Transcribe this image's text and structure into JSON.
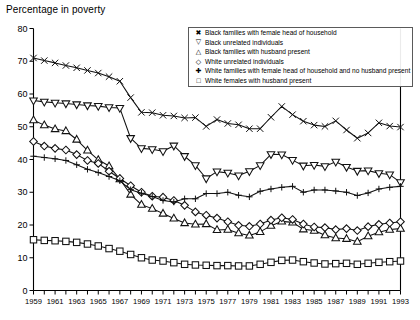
{
  "chart_data": {
    "type": "line",
    "title": "Percentage in poverty",
    "xlabel": "",
    "ylabel": "",
    "ylim": [
      0,
      80
    ],
    "ytick_step": 10,
    "yticks": [
      0,
      10,
      20,
      30,
      40,
      50,
      60,
      70,
      80
    ],
    "xlim": [
      1959,
      1993
    ],
    "grid": false,
    "legend_position": "top-right",
    "x": [
      1959,
      1960,
      1961,
      1962,
      1963,
      1964,
      1965,
      1966,
      1967,
      1968,
      1969,
      1970,
      1971,
      1972,
      1973,
      1974,
      1975,
      1976,
      1977,
      1978,
      1979,
      1980,
      1981,
      1982,
      1983,
      1984,
      1985,
      1986,
      1987,
      1988,
      1989,
      1990,
      1991,
      1992,
      1993
    ],
    "xtick_labels": [
      "1959",
      "1961",
      "1963",
      "1965",
      "1967",
      "1969",
      "1971",
      "1973",
      "1975",
      "1977",
      "1979",
      "1981",
      "1983",
      "1985",
      "1987",
      "1989",
      "1991",
      "1993"
    ],
    "series": [
      {
        "name": "Black families with female head of household",
        "marker": "x",
        "values": [
          71.0,
          70.2,
          69.5,
          68.7,
          68.0,
          67.2,
          66.4,
          65.3,
          63.9,
          58.9,
          54.4,
          54.3,
          53.5,
          53.3,
          52.7,
          52.8,
          50.1,
          52.2,
          51.0,
          50.6,
          49.4,
          49.4,
          52.9,
          56.2,
          53.7,
          51.7,
          50.5,
          50.1,
          51.8,
          49.0,
          46.5,
          48.1,
          51.2,
          50.2,
          49.9
        ]
      },
      {
        "name": "Black unrelated individuals",
        "marker": "triangle-down",
        "values": [
          58.0,
          57.6,
          57.3,
          57.1,
          56.8,
          56.5,
          56.3,
          55.9,
          55.7,
          46.5,
          43.4,
          43.1,
          42.5,
          44.2,
          41.0,
          38.2,
          34.2,
          36.3,
          35.9,
          35.1,
          36.4,
          38.2,
          41.6,
          41.5,
          39.8,
          38.1,
          38.3,
          37.9,
          39.3,
          37.7,
          36.5,
          36.6,
          35.8,
          35.4,
          33.0
        ]
      },
      {
        "name": "Black families with husband present",
        "marker": "triangle-up",
        "values": [
          52.0,
          50.5,
          49.3,
          48.7,
          46.1,
          42.8,
          39.9,
          38.0,
          34.0,
          29.3,
          26.2,
          25.0,
          23.5,
          22.0,
          20.6,
          20.2,
          20.3,
          18.5,
          18.6,
          17.5,
          16.8,
          17.9,
          19.8,
          21.1,
          20.8,
          18.7,
          18.3,
          16.9,
          16.0,
          15.8,
          14.9,
          16.6,
          17.8,
          18.6,
          18.9
        ]
      },
      {
        "name": "White unrelated individuals",
        "marker": "diamond",
        "values": [
          45.5,
          44.1,
          43.4,
          42.9,
          41.5,
          39.7,
          38.8,
          36.4,
          34.2,
          32.0,
          30.0,
          28.8,
          28.5,
          27.5,
          26.0,
          24.0,
          23.0,
          22.1,
          21.0,
          19.9,
          19.6,
          20.3,
          21.5,
          22.2,
          21.7,
          20.3,
          19.4,
          19.2,
          18.6,
          18.9,
          18.3,
          19.5,
          20.2,
          20.6,
          21.0
        ]
      },
      {
        "name": "White families with female head of household and no husband present",
        "marker": "plus",
        "values": [
          41.0,
          40.6,
          40.2,
          39.7,
          38.4,
          37.0,
          36.0,
          34.8,
          33.5,
          30.8,
          29.7,
          28.7,
          27.5,
          27.0,
          28.0,
          28.0,
          29.6,
          29.6,
          30.0,
          29.1,
          28.6,
          30.3,
          31.0,
          31.5,
          31.8,
          30.0,
          30.7,
          30.7,
          30.4,
          30.0,
          29.0,
          29.8,
          31.0,
          31.5,
          31.8
        ]
      },
      {
        "name": "White females with husband present",
        "marker": "square",
        "values": [
          15.5,
          15.3,
          15.2,
          15.0,
          14.7,
          14.2,
          13.6,
          12.8,
          12.0,
          11.0,
          10.0,
          9.3,
          9.0,
          8.5,
          8.0,
          7.8,
          7.7,
          7.6,
          7.6,
          7.5,
          7.5,
          8.0,
          8.6,
          9.2,
          9.3,
          8.8,
          8.4,
          8.1,
          8.2,
          8.3,
          8.0,
          8.3,
          8.6,
          8.8,
          9.0
        ]
      }
    ]
  },
  "legend": {
    "items": [
      {
        "symbol": "✖",
        "label": "Black families with female head of household"
      },
      {
        "symbol": "▽",
        "label": "Black unrelated individuals"
      },
      {
        "symbol": "△",
        "label": "Black families with husband present"
      },
      {
        "symbol": "◇",
        "label": "White unrelated individuals"
      },
      {
        "symbol": "✚",
        "label": "White families with female head of household and no husband present"
      },
      {
        "symbol": "□",
        "label": "White females with husband present"
      }
    ]
  }
}
